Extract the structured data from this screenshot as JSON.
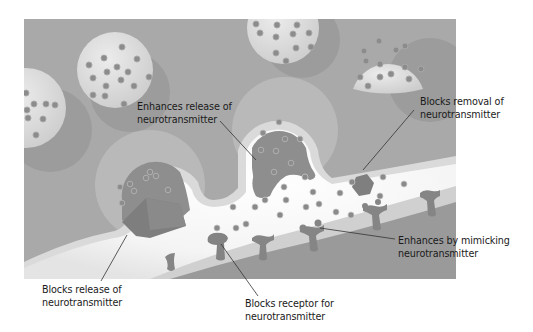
{
  "diagram": {
    "type": "synapse-drug-actions",
    "colors": {
      "presynaptic_bg": "#a9a9a9",
      "vesicle": "#dcdcdc",
      "vesicle_shadow": "#959595",
      "neurotransmitter": "#8c8c8c",
      "membrane": "#d8d8d8",
      "synaptic_cleft": "#ffffff",
      "postsynaptic_bg": "#9a9a9a",
      "drug": "#7f7f7f",
      "receptor": "#8a8a8a",
      "text": "#1a1a1a",
      "leader_line": "#333333"
    },
    "labels": [
      {
        "id": "enhances-release",
        "line1": "Enhances release of",
        "line2": "neurotransmitter"
      },
      {
        "id": "blocks-removal",
        "line1": "Blocks removal of",
        "line2": "neurotransmitter"
      },
      {
        "id": "enhances-mimicking",
        "line1": "Enhances by mimicking",
        "line2": "neurotransmitter"
      },
      {
        "id": "blocks-release",
        "line1": "Blocks release of",
        "line2": "neurotransmitter"
      },
      {
        "id": "blocks-receptor",
        "line1": "Blocks receptor for",
        "line2": "neurotransmitter"
      }
    ]
  }
}
